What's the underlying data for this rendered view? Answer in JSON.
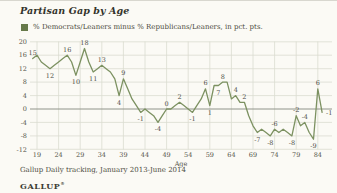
{
  "title": "Partisan Gap by Age",
  "legend": {
    "label": "% Democrats/Leaners minus % Republicans/Leaners, in pct. pts.",
    "swatch_color": "#66794a"
  },
  "footer": {
    "source": "Gallup Daily tracking, January 2013-June 2014",
    "brand": "GALLUP",
    "brand_mark": "®"
  },
  "colors": {
    "background": "#fbfaf5",
    "line": "#7c9161",
    "grid": "#dadcd1",
    "zero_line": "#90948a",
    "tick_text": "#55544a",
    "label_text": "#50504a"
  },
  "chart_data": {
    "type": "line",
    "title": "Partisan Gap by Age",
    "series_name": "% Democrats/Leaners minus % Republicans/Leaners",
    "xlabel": "Age",
    "ylabel": "",
    "age_min": 18,
    "age_max": 85,
    "values": [
      15,
      16,
      14,
      13,
      12,
      13,
      14,
      15,
      16,
      14,
      10,
      14,
      18,
      14,
      11,
      12,
      13,
      12,
      11,
      9,
      4,
      9,
      6,
      3,
      1,
      -1,
      0,
      -1,
      -2,
      -4,
      -2,
      0,
      0,
      1,
      2,
      1,
      0,
      -1,
      1,
      3,
      6,
      1,
      7,
      7,
      8,
      8,
      3,
      4,
      2,
      2,
      -2,
      -5,
      -7,
      -6,
      -7,
      -8,
      -6,
      -7,
      -6,
      -7,
      -8,
      -2,
      -5,
      -4,
      -7,
      -9,
      6,
      -1
    ],
    "x_ticks": [
      19,
      24,
      29,
      34,
      39,
      44,
      49,
      54,
      59,
      64,
      69,
      74,
      79,
      84
    ],
    "y_ticks": [
      20,
      16,
      12,
      8,
      4,
      0,
      -4,
      -8,
      -12
    ],
    "ylim": [
      -12,
      20
    ],
    "grid": true,
    "legend_position": "top-left",
    "point_labels": [
      {
        "age": 18,
        "text": "15",
        "pos": "above"
      },
      {
        "age": 22,
        "text": "12",
        "pos": "below"
      },
      {
        "age": 26,
        "text": "16",
        "pos": "above"
      },
      {
        "age": 28,
        "text": "10",
        "pos": "below"
      },
      {
        "age": 30,
        "text": "18",
        "pos": "above"
      },
      {
        "age": 32,
        "text": "11",
        "pos": "below"
      },
      {
        "age": 34,
        "text": "13",
        "pos": "above"
      },
      {
        "age": 38,
        "text": "4",
        "pos": "below"
      },
      {
        "age": 39,
        "text": "9",
        "pos": "above"
      },
      {
        "age": 43,
        "text": "-1",
        "pos": "below"
      },
      {
        "age": 47,
        "text": "-4",
        "pos": "below"
      },
      {
        "age": 49,
        "text": "0",
        "pos": "above"
      },
      {
        "age": 52,
        "text": "2",
        "pos": "above"
      },
      {
        "age": 55,
        "text": "-1",
        "pos": "below"
      },
      {
        "age": 58,
        "text": "6",
        "pos": "above"
      },
      {
        "age": 59,
        "text": "1",
        "pos": "below"
      },
      {
        "age": 61,
        "text": "7",
        "pos": "below"
      },
      {
        "age": 62,
        "text": "8",
        "pos": "above"
      },
      {
        "age": 65,
        "text": "4",
        "pos": "above"
      },
      {
        "age": 67,
        "text": "2",
        "pos": "above"
      },
      {
        "age": 70,
        "text": "-7",
        "pos": "below"
      },
      {
        "age": 73,
        "text": "-8",
        "pos": "below"
      },
      {
        "age": 74,
        "text": "-6",
        "pos": "above"
      },
      {
        "age": 78,
        "text": "-8",
        "pos": "below"
      },
      {
        "age": 79,
        "text": "-2",
        "pos": "above"
      },
      {
        "age": 81,
        "text": "-4",
        "pos": "above"
      },
      {
        "age": 83,
        "text": "-9",
        "pos": "below"
      },
      {
        "age": 84,
        "text": "6",
        "pos": "above"
      },
      {
        "age": 85,
        "text": "-1",
        "pos": "right"
      }
    ]
  }
}
